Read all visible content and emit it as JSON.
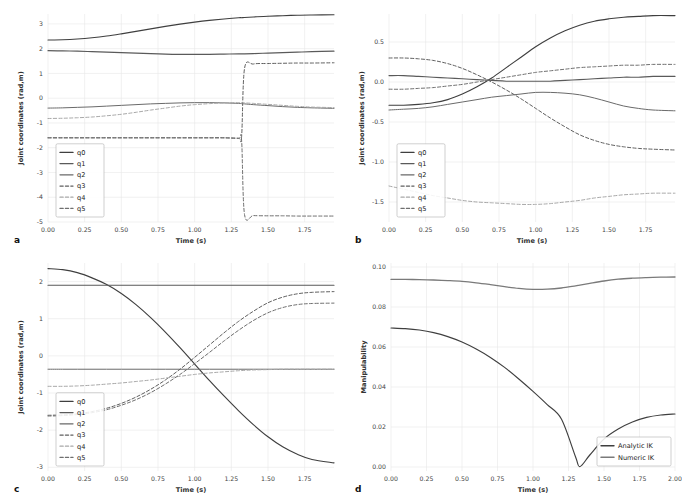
{
  "figure": {
    "panels": [
      "a",
      "b",
      "c",
      "d"
    ]
  },
  "panel_a": {
    "letter": "a",
    "xlabel": "Time (s)",
    "ylabel": "Joint coordinates (rad,m)",
    "xticks": [
      "0.00",
      "0.25",
      "0.50",
      "0.75",
      "1.00",
      "1.25",
      "1.50",
      "1.75"
    ],
    "yticks": [
      "3",
      "2",
      "1",
      "0",
      "-1",
      "-2",
      "-3",
      "-4",
      "-5"
    ],
    "legend": [
      "q0",
      "q1",
      "q2",
      "q3",
      "q4",
      "q5"
    ]
  },
  "panel_b": {
    "letter": "b",
    "xlabel": "Time (s)",
    "ylabel": "Joint coordinates (rad,m)",
    "xticks": [
      "0.00",
      "0.25",
      "0.50",
      "0.75",
      "1.00",
      "1.25",
      "1.50",
      "1.75"
    ],
    "yticks": [
      "0.5",
      "0.0",
      "-0.5",
      "-1.0",
      "-1.5"
    ],
    "legend": [
      "q0",
      "q1",
      "q2",
      "q3",
      "q4",
      "q5"
    ]
  },
  "panel_c": {
    "letter": "c",
    "xlabel": "Time (s)",
    "ylabel": "Joint coordinates (rad,m)",
    "xticks": [
      "0.00",
      "0.25",
      "0.50",
      "0.75",
      "1.00",
      "1.25",
      "1.50",
      "1.75"
    ],
    "yticks": [
      "2",
      "1",
      "0",
      "-1",
      "-2",
      "-3"
    ],
    "legend": [
      "q0",
      "q1",
      "q2",
      "q3",
      "q4",
      "q5"
    ]
  },
  "panel_d": {
    "letter": "d",
    "xlabel": "Time (s)",
    "ylabel": "Manipulability",
    "xticks": [
      "0.00",
      "0.25",
      "0.50",
      "0.75",
      "1.00",
      "1.25",
      "1.50",
      "1.75",
      "2.00"
    ],
    "yticks": [
      "0.10",
      "0.08",
      "0.06",
      "0.04",
      "0.02",
      "0.00"
    ],
    "legend": [
      "Analytic IK",
      "Numeric IK"
    ]
  },
  "colors": {
    "q0": "#3f3f3f",
    "q1": "#5a5a5a",
    "q2": "#6a6a6a",
    "q3": "#5f5f5f",
    "q4": "#a8a8a8",
    "q5": "#6f6f6f",
    "analytic": "#3f3f3f",
    "numeric": "#7a7a7a",
    "grid": "#e8e8e8",
    "background": "#ffffff"
  },
  "chart_data": [
    {
      "type": "line",
      "panel": "a",
      "title": "",
      "xlabel": "Time (s)",
      "ylabel": "Joint coordinates (rad,m)",
      "xlim": [
        0.0,
        1.95
      ],
      "ylim": [
        -5.0,
        3.4
      ],
      "grid": true,
      "legend_position": "lower left",
      "x": [
        0.0,
        0.1,
        0.2,
        0.3,
        0.4,
        0.5,
        0.6,
        0.7,
        0.8,
        0.9,
        1.0,
        1.1,
        1.2,
        1.3,
        1.32,
        1.34,
        1.4,
        1.5,
        1.6,
        1.7,
        1.8,
        1.95
      ],
      "series": [
        {
          "name": "q0",
          "style": "solid",
          "values": [
            2.35,
            2.36,
            2.39,
            2.44,
            2.51,
            2.6,
            2.7,
            2.8,
            2.9,
            2.99,
            3.07,
            3.14,
            3.2,
            3.25,
            3.25,
            3.26,
            3.28,
            3.31,
            3.33,
            3.35,
            3.36,
            3.37
          ]
        },
        {
          "name": "q1",
          "style": "solid",
          "values": [
            1.92,
            1.91,
            1.9,
            1.88,
            1.86,
            1.84,
            1.82,
            1.8,
            1.78,
            1.77,
            1.77,
            1.77,
            1.78,
            1.79,
            1.79,
            1.79,
            1.8,
            1.82,
            1.84,
            1.86,
            1.88,
            1.9
          ]
        },
        {
          "name": "q2",
          "style": "solid",
          "values": [
            -0.4,
            -0.39,
            -0.37,
            -0.35,
            -0.32,
            -0.29,
            -0.26,
            -0.23,
            -0.21,
            -0.19,
            -0.18,
            -0.18,
            -0.19,
            -0.21,
            -0.22,
            -0.23,
            -0.26,
            -0.3,
            -0.34,
            -0.37,
            -0.39,
            -0.41
          ]
        },
        {
          "name": "q3",
          "style": "dashed",
          "values": [
            -1.6,
            -1.6,
            -1.6,
            -1.6,
            -1.6,
            -1.6,
            -1.6,
            -1.6,
            -1.6,
            -1.6,
            -1.6,
            -1.6,
            -1.6,
            -1.62,
            -1.55,
            1.2,
            1.38,
            1.4,
            1.41,
            1.42,
            1.42,
            1.43
          ]
        },
        {
          "name": "q4",
          "style": "dashed",
          "values": [
            -0.82,
            -0.81,
            -0.79,
            -0.76,
            -0.71,
            -0.65,
            -0.57,
            -0.48,
            -0.4,
            -0.32,
            -0.26,
            -0.22,
            -0.19,
            -0.18,
            -0.18,
            -0.19,
            -0.21,
            -0.25,
            -0.29,
            -0.33,
            -0.36,
            -0.38
          ]
        },
        {
          "name": "q5",
          "style": "dashed",
          "values": [
            -1.6,
            -1.6,
            -1.6,
            -1.6,
            -1.6,
            -1.6,
            -1.6,
            -1.6,
            -1.6,
            -1.6,
            -1.6,
            -1.6,
            -1.6,
            -1.62,
            -1.7,
            -4.7,
            -4.74,
            -4.75,
            -4.75,
            -4.76,
            -4.76,
            -4.76
          ]
        }
      ]
    },
    {
      "type": "line",
      "panel": "b",
      "title": "",
      "xlabel": "Time (s)",
      "ylabel": "Joint coordinates (rad,m)",
      "xlim": [
        0.0,
        1.95
      ],
      "ylim": [
        -1.75,
        0.85
      ],
      "grid": true,
      "legend_position": "lower left",
      "x": [
        0.0,
        0.1,
        0.2,
        0.3,
        0.4,
        0.5,
        0.6,
        0.7,
        0.8,
        0.9,
        1.0,
        1.1,
        1.2,
        1.3,
        1.4,
        1.5,
        1.6,
        1.7,
        1.8,
        1.95
      ],
      "series": [
        {
          "name": "q0",
          "style": "solid",
          "values": [
            -0.29,
            -0.29,
            -0.28,
            -0.26,
            -0.22,
            -0.15,
            -0.06,
            0.05,
            0.18,
            0.31,
            0.44,
            0.55,
            0.64,
            0.71,
            0.76,
            0.79,
            0.81,
            0.82,
            0.83,
            0.83
          ]
        },
        {
          "name": "q1",
          "style": "solid",
          "values": [
            0.08,
            0.08,
            0.07,
            0.06,
            0.05,
            0.04,
            0.03,
            0.02,
            0.01,
            0.01,
            0.01,
            0.01,
            0.02,
            0.03,
            0.04,
            0.05,
            0.06,
            0.06,
            0.07,
            0.07
          ]
        },
        {
          "name": "q2",
          "style": "solid",
          "values": [
            -0.35,
            -0.34,
            -0.33,
            -0.31,
            -0.28,
            -0.25,
            -0.22,
            -0.19,
            -0.17,
            -0.15,
            -0.13,
            -0.13,
            -0.14,
            -0.16,
            -0.2,
            -0.25,
            -0.3,
            -0.33,
            -0.35,
            -0.36
          ]
        },
        {
          "name": "q3",
          "style": "dashed",
          "values": [
            0.3,
            0.3,
            0.29,
            0.27,
            0.23,
            0.17,
            0.09,
            0.0,
            -0.1,
            -0.21,
            -0.33,
            -0.45,
            -0.56,
            -0.66,
            -0.73,
            -0.78,
            -0.81,
            -0.83,
            -0.84,
            -0.85
          ]
        },
        {
          "name": "q4",
          "style": "dashed",
          "values": [
            -1.3,
            -1.34,
            -1.38,
            -1.42,
            -1.45,
            -1.48,
            -1.5,
            -1.51,
            -1.52,
            -1.53,
            -1.53,
            -1.52,
            -1.5,
            -1.48,
            -1.45,
            -1.43,
            -1.41,
            -1.4,
            -1.39,
            -1.39
          ]
        },
        {
          "name": "q5",
          "style": "dashed",
          "values": [
            -0.09,
            -0.09,
            -0.08,
            -0.07,
            -0.05,
            -0.03,
            0.0,
            0.03,
            0.06,
            0.09,
            0.12,
            0.14,
            0.16,
            0.18,
            0.19,
            0.2,
            0.21,
            0.21,
            0.22,
            0.22
          ]
        }
      ]
    },
    {
      "type": "line",
      "panel": "c",
      "title": "",
      "xlabel": "Time (s)",
      "ylabel": "Joint coordinates (rad,m)",
      "xlim": [
        0.0,
        1.95
      ],
      "ylim": [
        -3.1,
        2.5
      ],
      "grid": true,
      "legend_position": "lower left",
      "x": [
        0.0,
        0.1,
        0.2,
        0.3,
        0.4,
        0.5,
        0.6,
        0.7,
        0.8,
        0.9,
        1.0,
        1.1,
        1.2,
        1.3,
        1.4,
        1.5,
        1.6,
        1.7,
        1.8,
        1.95
      ],
      "series": [
        {
          "name": "q0",
          "style": "solid",
          "values": [
            2.35,
            2.32,
            2.24,
            2.1,
            1.92,
            1.68,
            1.38,
            1.03,
            0.64,
            0.22,
            -0.22,
            -0.66,
            -1.08,
            -1.48,
            -1.85,
            -2.18,
            -2.45,
            -2.65,
            -2.79,
            -2.88
          ]
        },
        {
          "name": "q1",
          "style": "solid",
          "values": [
            1.9,
            1.9,
            1.9,
            1.9,
            1.9,
            1.9,
            1.9,
            1.9,
            1.9,
            1.9,
            1.9,
            1.9,
            1.9,
            1.9,
            1.9,
            1.9,
            1.9,
            1.9,
            1.9,
            1.9
          ]
        },
        {
          "name": "q2",
          "style": "solid",
          "values": [
            -0.36,
            -0.36,
            -0.36,
            -0.36,
            -0.36,
            -0.36,
            -0.36,
            -0.36,
            -0.36,
            -0.36,
            -0.36,
            -0.36,
            -0.36,
            -0.36,
            -0.36,
            -0.36,
            -0.36,
            -0.36,
            -0.36,
            -0.36
          ]
        },
        {
          "name": "q3",
          "style": "dashed",
          "values": [
            -1.6,
            -1.59,
            -1.56,
            -1.5,
            -1.41,
            -1.28,
            -1.11,
            -0.9,
            -0.65,
            -0.36,
            -0.04,
            0.29,
            0.62,
            0.93,
            1.2,
            1.43,
            1.58,
            1.67,
            1.71,
            1.73
          ]
        },
        {
          "name": "q4",
          "style": "dashed",
          "values": [
            -0.82,
            -0.82,
            -0.81,
            -0.79,
            -0.76,
            -0.73,
            -0.69,
            -0.65,
            -0.6,
            -0.55,
            -0.5,
            -0.46,
            -0.43,
            -0.4,
            -0.38,
            -0.37,
            -0.36,
            -0.36,
            -0.36,
            -0.36
          ]
        },
        {
          "name": "q5",
          "style": "dashed",
          "values": [
            -1.62,
            -1.61,
            -1.58,
            -1.53,
            -1.45,
            -1.33,
            -1.18,
            -0.99,
            -0.76,
            -0.5,
            -0.21,
            0.09,
            0.4,
            0.69,
            0.95,
            1.16,
            1.3,
            1.38,
            1.41,
            1.42
          ]
        }
      ]
    },
    {
      "type": "line",
      "panel": "d",
      "title": "",
      "xlabel": "Time (s)",
      "ylabel": "Manipulability",
      "xlim": [
        0.0,
        2.0
      ],
      "ylim": [
        -0.002,
        0.102
      ],
      "grid": true,
      "legend_position": "lower right",
      "x": [
        0.0,
        0.1,
        0.2,
        0.3,
        0.4,
        0.5,
        0.6,
        0.7,
        0.8,
        0.9,
        1.0,
        1.1,
        1.2,
        1.3,
        1.33,
        1.4,
        1.5,
        1.6,
        1.7,
        1.8,
        1.9,
        2.0
      ],
      "series": [
        {
          "name": "Analytic IK",
          "style": "solid",
          "values": [
            0.0695,
            0.0692,
            0.0685,
            0.0672,
            0.0652,
            0.0625,
            0.059,
            0.0548,
            0.0498,
            0.044,
            0.0378,
            0.0312,
            0.024,
            0.005,
            0.0002,
            0.006,
            0.014,
            0.019,
            0.0225,
            0.0248,
            0.026,
            0.0265
          ]
        },
        {
          "name": "Numeric IK",
          "style": "solid",
          "values": [
            0.0938,
            0.0938,
            0.0937,
            0.0935,
            0.0932,
            0.0928,
            0.0921,
            0.0912,
            0.0902,
            0.0893,
            0.0888,
            0.0889,
            0.0895,
            0.0906,
            0.0909,
            0.0918,
            0.093,
            0.0939,
            0.0944,
            0.0947,
            0.0949,
            0.095
          ]
        }
      ]
    }
  ]
}
